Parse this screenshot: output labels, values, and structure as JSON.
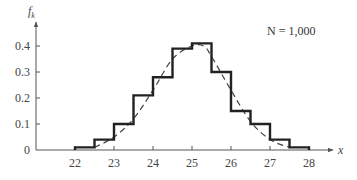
{
  "chart_data": {
    "type": "line",
    "title": "",
    "xlabel": "x",
    "ylabel": "f_k",
    "ylabel_main": "f",
    "ylabel_sub": "k",
    "annotation": "N = 1,000",
    "xlim": [
      21.2,
      28.6
    ],
    "ylim": [
      0,
      0.47
    ],
    "x_ticks": [
      22,
      23,
      24,
      25,
      26,
      27,
      28
    ],
    "y_ticks": [
      0,
      0.1,
      0.2,
      0.3,
      0.4
    ],
    "y_tick_labels": [
      "0",
      "0.1",
      "0.2",
      "0.3",
      "0.4"
    ],
    "grid": false,
    "legend": null,
    "series": [
      {
        "name": "relative frequency histogram (step)",
        "style": "solid-step",
        "bin_edges": [
          22,
          22.5,
          23,
          23.5,
          24,
          24.5,
          25,
          25.5,
          26,
          26.5,
          27,
          27.5,
          28
        ],
        "values": [
          0.01,
          0.04,
          0.1,
          0.21,
          0.28,
          0.39,
          0.41,
          0.3,
          0.15,
          0.1,
          0.04,
          0.01
        ]
      },
      {
        "name": "fitted density (dashed)",
        "style": "dashed",
        "x": [
          22.5,
          23,
          23.5,
          24,
          24.5,
          25,
          25.3,
          25.5,
          26,
          26.5,
          27,
          27.5
        ],
        "values": [
          0.01,
          0.05,
          0.12,
          0.23,
          0.35,
          0.4,
          0.4,
          0.36,
          0.23,
          0.11,
          0.04,
          0.01
        ]
      }
    ]
  }
}
